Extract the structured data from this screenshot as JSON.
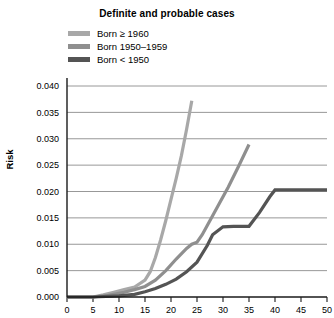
{
  "chart_data": {
    "type": "line",
    "title": "Definite and probable cases",
    "xlabel": "",
    "ylabel": "Risk",
    "xlim": [
      0,
      50
    ],
    "ylim": [
      0.0,
      0.04
    ],
    "grid": true,
    "legend_position": "top-left",
    "xticks": [
      0,
      5,
      10,
      15,
      20,
      25,
      30,
      35,
      40,
      45,
      50
    ],
    "xtick_labels": [
      "0",
      "5",
      "10",
      "15",
      "20",
      "25",
      "30",
      "35",
      "40",
      "45",
      "50"
    ],
    "yticks": [
      0.0,
      0.005,
      0.01,
      0.015,
      0.02,
      0.025,
      0.03,
      0.035,
      0.04
    ],
    "ytick_labels": [
      "0.000",
      "0.005",
      "0.010",
      "0.015",
      "0.020",
      "0.025",
      "0.030",
      "0.035",
      "0.040"
    ],
    "series": [
      {
        "name": "Born ≥ 1960",
        "color": "#a8a8a8",
        "x": [
          0,
          5,
          7,
          9,
          11,
          13,
          15,
          16,
          17,
          18,
          19,
          20,
          21,
          22,
          23,
          24
        ],
        "values": [
          0.0,
          0.0,
          0.0004,
          0.0009,
          0.0014,
          0.0019,
          0.0032,
          0.0048,
          0.0075,
          0.0108,
          0.0145,
          0.0185,
          0.0225,
          0.0268,
          0.0318,
          0.0372
        ]
      },
      {
        "name": "Born 1950–1959",
        "color": "#8f8f8f",
        "x": [
          0,
          5,
          8,
          11,
          13,
          15,
          17,
          19,
          21,
          23,
          24,
          25,
          26,
          27,
          29,
          31,
          33,
          35
        ],
        "values": [
          0.0,
          0.0,
          0.0003,
          0.0009,
          0.0014,
          0.002,
          0.0032,
          0.005,
          0.0072,
          0.0092,
          0.01,
          0.0104,
          0.0118,
          0.0136,
          0.0172,
          0.0208,
          0.0248,
          0.0289
        ]
      },
      {
        "name": "Born < 1950",
        "color": "#545454",
        "x": [
          0,
          5,
          10,
          13,
          15,
          17,
          19,
          21,
          23,
          25,
          27,
          28,
          30,
          32,
          33,
          35,
          37,
          39,
          40,
          45,
          50
        ],
        "values": [
          0.0,
          0.0,
          0.0002,
          0.0005,
          0.001,
          0.0016,
          0.0024,
          0.0034,
          0.0048,
          0.0066,
          0.0098,
          0.0118,
          0.0133,
          0.0134,
          0.0134,
          0.0134,
          0.016,
          0.019,
          0.0203,
          0.0203,
          0.0203
        ]
      }
    ]
  }
}
